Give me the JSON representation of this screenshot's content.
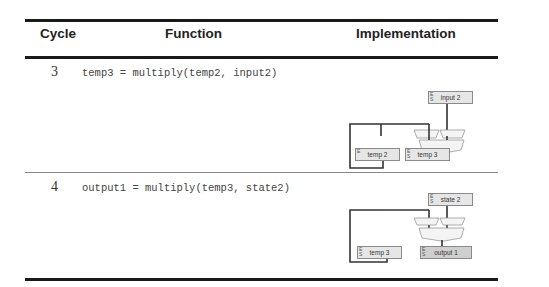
{
  "table": {
    "headers": {
      "cycle": "Cycle",
      "function": "Function",
      "implementation": "Implementation"
    },
    "rows": [
      {
        "cycle": "3",
        "function": "temp3 = multiply(temp2, input2)",
        "diagram": {
          "top_register": {
            "label": "input 2",
            "tag": "E\nS"
          },
          "left_register": {
            "label": "temp 2",
            "tag": "E"
          },
          "output_register": {
            "label": "temp 3",
            "tag": "E\nS\nL"
          }
        }
      },
      {
        "cycle": "4",
        "function": "output1 = multiply(temp3, state2)",
        "diagram": {
          "top_register": {
            "label": "state 2",
            "tag": "E\nS"
          },
          "left_register": {
            "label": "temp 3",
            "tag": "E\nS"
          },
          "output_register": {
            "label": "output 1",
            "tag": "E\nS"
          }
        }
      }
    ]
  }
}
